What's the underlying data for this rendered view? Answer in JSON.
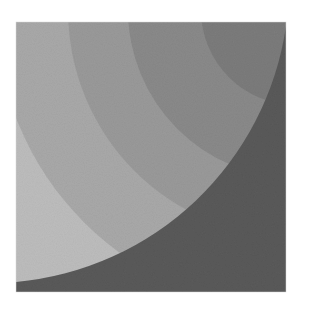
{
  "image": {
    "subject": "halftone print of concentric gray arc bands within a square",
    "square": {
      "x": 16,
      "y": 22,
      "size": 270
    },
    "colors": {
      "background": "#ffffff",
      "band_lightest": "#bdbdbd",
      "band_light": "#a9a9a9",
      "band_mid": "#9a9a9a",
      "band_midDark": "#8a8a8a",
      "band_dark": "#7c7c7c",
      "corner_dark": "#5a5a5a"
    }
  }
}
